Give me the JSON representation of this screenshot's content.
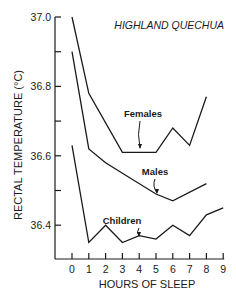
{
  "chart_data": {
    "type": "line",
    "title": "HIGHLAND QUECHUA",
    "xlabel": "HOURS OF SLEEP",
    "ylabel": "RECTAL TEMPERATURE (°C)",
    "x": [
      0,
      1,
      2,
      3,
      4,
      5,
      6,
      7,
      8,
      9
    ],
    "x_tick_labels": [
      "0",
      "1",
      "2",
      "3",
      "4",
      "5",
      "6",
      "7",
      "8",
      "9"
    ],
    "y_tick_labels": [
      "37.0",
      "36.8",
      "36.6",
      "36.4"
    ],
    "y_ticks": [
      37.0,
      36.9,
      36.8,
      36.7,
      36.6,
      36.5,
      36.4
    ],
    "ylim": [
      36.3,
      37.0
    ],
    "xlim": [
      0,
      9
    ],
    "grid": false,
    "legend": "inline annotations with arrows",
    "series": [
      {
        "name": "Females",
        "x": [
          0,
          1,
          3,
          5,
          6,
          7,
          8
        ],
        "values": [
          37.0,
          36.78,
          36.61,
          36.61,
          36.68,
          36.63,
          36.77
        ]
      },
      {
        "name": "Males",
        "x": [
          0,
          1,
          2,
          3,
          5,
          6,
          8
        ],
        "values": [
          36.9,
          36.62,
          36.58,
          36.55,
          36.49,
          36.47,
          36.52
        ]
      },
      {
        "name": "Children",
        "x": [
          0,
          1,
          2,
          3,
          4,
          5,
          6,
          7,
          8,
          9
        ],
        "values": [
          36.63,
          36.35,
          36.4,
          36.35,
          36.37,
          36.36,
          36.4,
          36.37,
          36.43,
          36.45
        ]
      }
    ],
    "annotations": [
      {
        "text": "Females",
        "points_to_x": 4
      },
      {
        "text": "Males",
        "points_to_x": 5
      },
      {
        "text": "Children",
        "points_to_x": 4
      }
    ]
  }
}
